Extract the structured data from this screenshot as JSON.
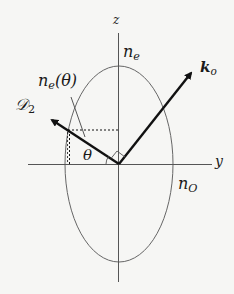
{
  "diagram": {
    "type": "index-ellipsoid",
    "labels": {
      "z_axis": "z",
      "y_axis": "y",
      "ne_base": "n",
      "ne_sub": "e",
      "no_base": "n",
      "no_sub": "O",
      "netheta_base": "n",
      "netheta_sub": "e",
      "netheta_arg": "(θ)",
      "ko_base": "k",
      "ko_sub": "o",
      "d2_base": "𝒟",
      "d2_sub": "2",
      "theta": "θ"
    },
    "colors": {
      "background": "#f6f6f4",
      "line": "#555555",
      "vector": "#111111",
      "text": "#1a1a1a"
    },
    "geometry": {
      "origin": [
        119,
        164
      ],
      "ellipse_rx": 54,
      "ellipse_ry": 98,
      "z_axis": {
        "top": 33,
        "bottom": 282
      },
      "y_axis": {
        "left": 28,
        "right": 212
      },
      "ko_tip": [
        193,
        70
      ],
      "d2_tip": [
        49,
        118
      ]
    }
  }
}
